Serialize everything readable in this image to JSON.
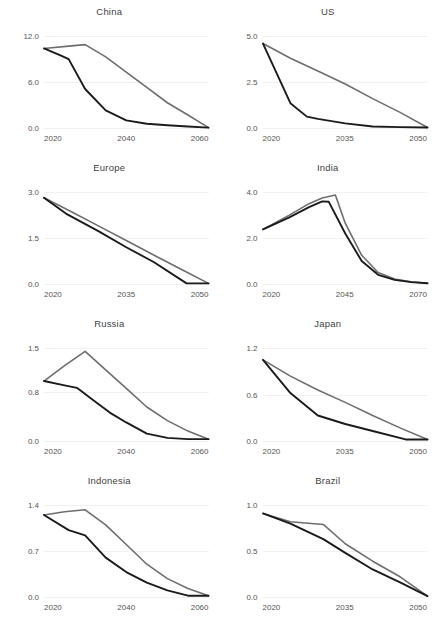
{
  "figure": {
    "background": "#ffffff",
    "rows": 4,
    "cols": 2,
    "series_colors": {
      "gray": "#6e6e6e",
      "dark": "#1b1b1b"
    }
  },
  "chart_data": [
    {
      "type": "line",
      "title": "China",
      "xlabel": "",
      "ylabel": "",
      "xlim": [
        2020,
        2060
      ],
      "ylim": [
        0.0,
        13.2
      ],
      "xticks": [
        2020,
        2040,
        2060
      ],
      "xticklabels": [
        "2020",
        "2040",
        "2060"
      ],
      "yticks": [
        0.0,
        6.0,
        12.0
      ],
      "yticklabels": [
        "0.0",
        "6.0",
        "12.0"
      ],
      "grid": true,
      "legend": "none",
      "series": [
        {
          "name": "gray",
          "x": [
            2020,
            2026,
            2030,
            2035,
            2040,
            2045,
            2050,
            2055,
            2060
          ],
          "values": [
            10.4,
            10.7,
            10.9,
            9.3,
            7.3,
            5.3,
            3.3,
            1.7,
            0.05
          ]
        },
        {
          "name": "dark",
          "x": [
            2020,
            2024,
            2026,
            2030,
            2035,
            2040,
            2045,
            2050,
            2055,
            2060
          ],
          "values": [
            10.4,
            9.5,
            9.0,
            5.1,
            2.3,
            1.0,
            0.55,
            0.35,
            0.2,
            0.05
          ]
        }
      ]
    },
    {
      "type": "line",
      "title": "US",
      "xlabel": "",
      "ylabel": "",
      "xlim": [
        2020,
        2050
      ],
      "ylim": [
        0.0,
        5.5
      ],
      "xticks": [
        2020,
        2035,
        2050
      ],
      "xticklabels": [
        "2020",
        "2035",
        "2050"
      ],
      "yticks": [
        0.0,
        2.5,
        5.0
      ],
      "yticklabels": [
        "0.0",
        "2.5",
        "5.0"
      ],
      "grid": true,
      "legend": "none",
      "series": [
        {
          "name": "gray",
          "x": [
            2020,
            2025,
            2030,
            2035,
            2040,
            2045,
            2050
          ],
          "values": [
            4.6,
            3.8,
            3.1,
            2.4,
            1.6,
            0.85,
            0.03
          ]
        },
        {
          "name": "dark",
          "x": [
            2020,
            2025,
            2028,
            2030,
            2035,
            2040,
            2045,
            2050
          ],
          "values": [
            4.6,
            1.35,
            0.62,
            0.5,
            0.25,
            0.08,
            0.05,
            0.03
          ]
        }
      ]
    },
    {
      "type": "line",
      "title": "Europe",
      "xlabel": "",
      "ylabel": "",
      "xlim": [
        2020,
        2050
      ],
      "ylim": [
        0.0,
        3.3
      ],
      "xticks": [
        2020,
        2035,
        2050
      ],
      "xticklabels": [
        "2020",
        "2035",
        "2050"
      ],
      "yticks": [
        0.0,
        1.5,
        3.0
      ],
      "yticklabels": [
        "0.0",
        "1.5",
        "3.0"
      ],
      "grid": true,
      "legend": "none",
      "series": [
        {
          "name": "gray",
          "x": [
            2020,
            2025,
            2030,
            2035,
            2040,
            2045,
            2050
          ],
          "values": [
            2.82,
            2.36,
            1.89,
            1.42,
            0.95,
            0.48,
            0.02
          ]
        },
        {
          "name": "dark",
          "x": [
            2020,
            2024,
            2030,
            2035,
            2040,
            2046,
            2050
          ],
          "values": [
            2.82,
            2.3,
            1.72,
            1.2,
            0.72,
            0.02,
            0.02
          ]
        }
      ]
    },
    {
      "type": "line",
      "title": "India",
      "xlabel": "",
      "ylabel": "",
      "xlim": [
        2020,
        2070
      ],
      "ylim": [
        0.0,
        4.4
      ],
      "xticks": [
        2020,
        2045,
        2070
      ],
      "xticklabels": [
        "2020",
        "2045",
        "2070"
      ],
      "yticks": [
        0.0,
        2.0,
        4.0
      ],
      "yticklabels": [
        "0.0",
        "2.0",
        "4.0"
      ],
      "grid": true,
      "legend": "none",
      "series": [
        {
          "name": "gray",
          "x": [
            2020,
            2028,
            2034,
            2038,
            2042,
            2045,
            2050,
            2055,
            2060,
            2065,
            2070
          ],
          "values": [
            2.38,
            3.0,
            3.5,
            3.75,
            3.88,
            2.65,
            1.25,
            0.5,
            0.22,
            0.1,
            0.03
          ]
        },
        {
          "name": "dark",
          "x": [
            2020,
            2028,
            2034,
            2038,
            2040,
            2045,
            2050,
            2055,
            2060,
            2065,
            2070
          ],
          "values": [
            2.38,
            2.9,
            3.35,
            3.6,
            3.58,
            2.2,
            1.0,
            0.4,
            0.18,
            0.08,
            0.03
          ]
        }
      ]
    },
    {
      "type": "line",
      "title": "Russia",
      "xlabel": "",
      "ylabel": "",
      "xlim": [
        2020,
        2060
      ],
      "ylim": [
        0.0,
        1.65
      ],
      "xticks": [
        2020,
        2040,
        2060
      ],
      "xticklabels": [
        "2020",
        "2040",
        "2060"
      ],
      "yticks": [
        0.0,
        0.8,
        1.5
      ],
      "yticklabels": [
        "0.0",
        "0.8",
        "1.5"
      ],
      "grid": true,
      "legend": "none",
      "series": [
        {
          "name": "gray",
          "x": [
            2020,
            2025,
            2030,
            2035,
            2040,
            2045,
            2050,
            2055,
            2060
          ],
          "values": [
            0.97,
            1.22,
            1.45,
            1.15,
            0.85,
            0.55,
            0.33,
            0.16,
            0.03
          ]
        },
        {
          "name": "dark",
          "x": [
            2020,
            2025,
            2028,
            2032,
            2036,
            2040,
            2045,
            2050,
            2055,
            2060
          ],
          "values": [
            0.97,
            0.9,
            0.86,
            0.66,
            0.46,
            0.3,
            0.12,
            0.05,
            0.03,
            0.03
          ]
        }
      ]
    },
    {
      "type": "line",
      "title": "Japan",
      "xlabel": "",
      "ylabel": "",
      "xlim": [
        2020,
        2050
      ],
      "ylim": [
        0.0,
        1.32
      ],
      "xticks": [
        2020,
        2035,
        2050
      ],
      "xticklabels": [
        "2020",
        "2035",
        "2050"
      ],
      "yticks": [
        0.0,
        0.6,
        1.2
      ],
      "yticklabels": [
        "0.0",
        "0.6",
        "1.2"
      ],
      "grid": true,
      "legend": "none",
      "series": [
        {
          "name": "gray",
          "x": [
            2020,
            2025,
            2030,
            2035,
            2040,
            2045,
            2050
          ],
          "values": [
            1.05,
            0.84,
            0.66,
            0.5,
            0.33,
            0.17,
            0.02
          ]
        },
        {
          "name": "dark",
          "x": [
            2020,
            2025,
            2030,
            2035,
            2040,
            2046,
            2050
          ],
          "values": [
            1.05,
            0.62,
            0.33,
            0.22,
            0.13,
            0.02,
            0.02
          ]
        }
      ]
    },
    {
      "type": "line",
      "title": "Indonesia",
      "xlabel": "",
      "ylabel": "",
      "xlim": [
        2020,
        2060
      ],
      "ylim": [
        0.0,
        1.54
      ],
      "xticks": [
        2020,
        2040,
        2060
      ],
      "xticklabels": [
        "2020",
        "2040",
        "2060"
      ],
      "yticks": [
        0.0,
        0.7,
        1.4
      ],
      "yticklabels": [
        "0.0",
        "0.7",
        "1.4"
      ],
      "grid": true,
      "legend": "none",
      "series": [
        {
          "name": "gray",
          "x": [
            2020,
            2025,
            2030,
            2035,
            2040,
            2045,
            2050,
            2055,
            2060
          ],
          "values": [
            1.25,
            1.3,
            1.33,
            1.1,
            0.8,
            0.5,
            0.28,
            0.13,
            0.02
          ]
        },
        {
          "name": "dark",
          "x": [
            2020,
            2026,
            2030,
            2035,
            2040,
            2045,
            2050,
            2055,
            2060
          ],
          "values": [
            1.25,
            1.02,
            0.94,
            0.6,
            0.38,
            0.22,
            0.1,
            0.02,
            0.02
          ]
        }
      ]
    },
    {
      "type": "line",
      "title": "Brazil",
      "xlabel": "",
      "ylabel": "",
      "xlim": [
        2020,
        2050
      ],
      "ylim": [
        0.0,
        1.1
      ],
      "xticks": [
        2020,
        2035,
        2050
      ],
      "xticklabels": [
        "2020",
        "2035",
        "2050"
      ],
      "yticks": [
        0.0,
        0.5,
        1.0
      ],
      "yticklabels": [
        "0.0",
        "0.5",
        "1.0"
      ],
      "grid": true,
      "legend": "none",
      "series": [
        {
          "name": "gray",
          "x": [
            2020,
            2025,
            2031,
            2035,
            2040,
            2045,
            2050
          ],
          "values": [
            0.91,
            0.82,
            0.79,
            0.58,
            0.39,
            0.22,
            0.01
          ]
        },
        {
          "name": "dark",
          "x": [
            2020,
            2025,
            2031,
            2035,
            2040,
            2045,
            2050
          ],
          "values": [
            0.91,
            0.8,
            0.63,
            0.48,
            0.3,
            0.16,
            0.01
          ]
        }
      ]
    }
  ]
}
